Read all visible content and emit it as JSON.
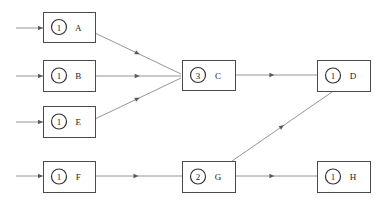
{
  "diagram": {
    "canvas": {
      "width": 389,
      "height": 204
    },
    "colors": {
      "background": "#ffffff",
      "box_stroke": "#4a4a4a",
      "circle_stroke": "#333333",
      "edge": "#8a8a8a",
      "arrowhead": "#5a5a5a",
      "text": "#222222"
    },
    "nodes": [
      {
        "id": "A",
        "label": "A",
        "token": "1",
        "x": 43,
        "y": 12,
        "w": 52,
        "h": 30
      },
      {
        "id": "B",
        "label": "B",
        "token": "1",
        "x": 43,
        "y": 60,
        "w": 52,
        "h": 31
      },
      {
        "id": "E",
        "label": "E",
        "token": "1",
        "x": 43,
        "y": 106,
        "w": 52,
        "h": 31
      },
      {
        "id": "F",
        "label": "F",
        "token": "1",
        "x": 43,
        "y": 161,
        "w": 52,
        "h": 31
      },
      {
        "id": "C",
        "label": "C",
        "token": "3",
        "x": 182,
        "y": 60,
        "w": 53,
        "h": 30
      },
      {
        "id": "G",
        "label": "G",
        "token": "2",
        "x": 182,
        "y": 161,
        "w": 53,
        "h": 31
      },
      {
        "id": "D",
        "label": "D",
        "token": "1",
        "x": 317,
        "y": 60,
        "w": 53,
        "h": 31
      },
      {
        "id": "H",
        "label": "H",
        "token": "1",
        "x": 317,
        "y": 161,
        "w": 53,
        "h": 31
      }
    ],
    "edges": [
      {
        "id": "in-A",
        "from": "",
        "to": "A",
        "x1": 16,
        "y1": 28,
        "x2": 43,
        "y2": 28,
        "head_t": 1.0
      },
      {
        "id": "in-B",
        "from": "",
        "to": "B",
        "x1": 16,
        "y1": 76,
        "x2": 43,
        "y2": 76,
        "head_t": 1.0
      },
      {
        "id": "in-E",
        "from": "",
        "to": "E",
        "x1": 16,
        "y1": 122,
        "x2": 43,
        "y2": 122,
        "head_t": 1.0
      },
      {
        "id": "in-F",
        "from": "",
        "to": "F",
        "x1": 16,
        "y1": 176,
        "x2": 43,
        "y2": 176,
        "head_t": 1.0
      },
      {
        "id": "A-C",
        "from": "A",
        "to": "C",
        "x1": 95,
        "y1": 33,
        "x2": 181,
        "y2": 74,
        "head_t": 0.52
      },
      {
        "id": "B-C",
        "from": "B",
        "to": "C",
        "x1": 95,
        "y1": 76,
        "x2": 181,
        "y2": 76,
        "head_t": 0.52
      },
      {
        "id": "E-C",
        "from": "E",
        "to": "C",
        "x1": 95,
        "y1": 119,
        "x2": 181,
        "y2": 78,
        "head_t": 0.52
      },
      {
        "id": "C-D",
        "from": "C",
        "to": "D",
        "x1": 235,
        "y1": 75,
        "x2": 317,
        "y2": 75,
        "head_t": 0.48
      },
      {
        "id": "F-G",
        "from": "F",
        "to": "G",
        "x1": 95,
        "y1": 176,
        "x2": 182,
        "y2": 176,
        "head_t": 0.5
      },
      {
        "id": "G-D",
        "from": "G",
        "to": "D",
        "x1": 232,
        "y1": 161,
        "x2": 332,
        "y2": 92,
        "head_t": 0.52
      },
      {
        "id": "G-H",
        "from": "G",
        "to": "H",
        "x1": 235,
        "y1": 176,
        "x2": 317,
        "y2": 176,
        "head_t": 0.48
      }
    ]
  }
}
